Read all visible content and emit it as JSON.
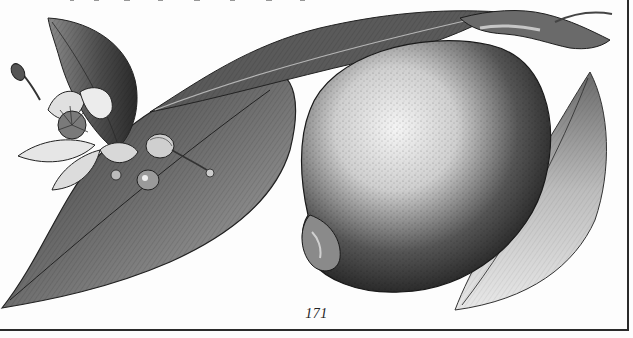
{
  "page": {
    "type": "scanned-book-page",
    "page_number": "171",
    "illustration": {
      "subject": "pencil botanical drawing of a lemon on a branch",
      "elements": [
        "lemon-fruit",
        "leaves",
        "lemon-blossom",
        "flower-buds",
        "branch-stem"
      ],
      "style": "monochrome graphite stipple"
    },
    "colors": {
      "paper": "#fdfdfd",
      "ink": "#1a1a1a",
      "frame": "#2a2a2a"
    }
  }
}
